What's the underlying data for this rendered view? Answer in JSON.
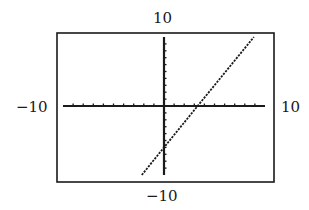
{
  "window": {
    "xmin_label": "−10",
    "xmax_label": "10",
    "ymin_label": "−10",
    "ymax_label": "10"
  },
  "colors": {
    "frame": "#1a1a1a",
    "axes": "#1a1a1a",
    "line": "#1a1a1a",
    "background": "#ffffff"
  },
  "chart_data": {
    "type": "line",
    "title": "",
    "xlabel": "",
    "ylabel": "",
    "xlim": [
      -10,
      10
    ],
    "ylim": [
      -10,
      10
    ],
    "xscale_ticks": 1,
    "yscale_ticks": 1,
    "grid": false,
    "legend": null,
    "tick_labels": {
      "x_left": "−10",
      "x_right": "10",
      "y_top": "10",
      "y_bottom": "−10"
    },
    "series": [
      {
        "name": "y = 1.8x - 6",
        "style": "dotted calculator pixels",
        "x": [
          -2.2,
          0,
          3.33,
          8.9
        ],
        "y": [
          -10,
          -6,
          0,
          10
        ]
      }
    ],
    "annotations": {
      "x_intercept": 3.33,
      "y_intercept": -6
    }
  }
}
